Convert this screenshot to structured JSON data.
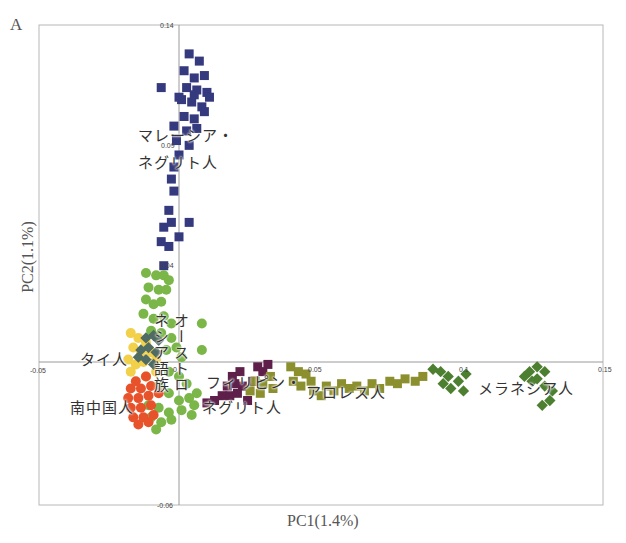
{
  "panel_letter": "A",
  "chart_data": {
    "type": "scatter",
    "title": "",
    "xlabel": "PC1(1.4%)",
    "ylabel": "PC2(1.1%)",
    "xlim": [
      -0.05,
      0.15
    ],
    "ylim": [
      -0.06,
      0.14
    ],
    "x_ticks": [
      "-0.05",
      "0.05",
      "0.1",
      "0.15"
    ],
    "y_ticks": [
      "0.14",
      "0.09",
      "0.04",
      "-0.06"
    ],
    "tick_labels_rendered": {
      "y_top": "0.14",
      "y_mid1": "0.09",
      "y_mid2": "0.04",
      "y_bottom": "-0.06",
      "x_left": "-0.05",
      "x_mid1": "0.05",
      "x_mid2": "0.1",
      "x_right": "0.15",
      "origin": "0"
    },
    "grid": false,
    "legend": "inline labels",
    "series": [
      {
        "name": "マレーシア・ネグリト人",
        "color": "#353a7e",
        "marker": "square",
        "points": [
          [
            0.004,
            0.128
          ],
          [
            0.008,
            0.125
          ],
          [
            0.002,
            0.121
          ],
          [
            0.006,
            0.118
          ],
          [
            0.01,
            0.119
          ],
          [
            0.003,
            0.114
          ],
          [
            0.007,
            0.113
          ],
          [
            0.011,
            0.112
          ],
          [
            0.001,
            0.109
          ],
          [
            0.005,
            0.108
          ],
          [
            0.009,
            0.106
          ],
          [
            0.002,
            0.102
          ],
          [
            0.006,
            0.101
          ],
          [
            0.01,
            0.104
          ],
          [
            -0.002,
            0.098
          ],
          [
            0.003,
            0.096
          ],
          [
            0.007,
            0.097
          ],
          [
            -0.001,
            0.092
          ],
          [
            0.004,
            0.09
          ],
          [
            0.0,
            0.086
          ],
          [
            -0.002,
            0.081
          ],
          [
            -0.003,
            0.076
          ],
          [
            -0.002,
            0.071
          ],
          [
            -0.004,
            0.063
          ],
          [
            -0.003,
            0.058
          ],
          [
            -0.006,
            0.056
          ],
          [
            0.004,
            0.058
          ],
          [
            -0.007,
            0.05
          ],
          [
            -0.004,
            0.048
          ],
          [
            -0.006,
            0.04
          ],
          [
            0.0,
            0.052
          ],
          [
            0.006,
            0.111
          ],
          [
            0.012,
            0.11
          ],
          [
            0.0,
            0.11
          ],
          [
            -0.007,
            0.114
          ]
        ]
      },
      {
        "name": "オーストロネシア語族",
        "color": "#7ab648",
        "marker": "circle",
        "points": [
          [
            -0.013,
            0.037
          ],
          [
            -0.009,
            0.036
          ],
          [
            -0.006,
            0.036
          ],
          [
            -0.004,
            0.034
          ],
          [
            -0.012,
            0.031
          ],
          [
            -0.008,
            0.03
          ],
          [
            -0.005,
            0.03
          ],
          [
            -0.013,
            0.026
          ],
          [
            -0.01,
            0.024
          ],
          [
            -0.007,
            0.025
          ],
          [
            -0.014,
            0.02
          ],
          [
            -0.01,
            0.018
          ],
          [
            -0.006,
            0.019
          ],
          [
            -0.003,
            0.016
          ],
          [
            -0.011,
            0.013
          ],
          [
            -0.007,
            0.012
          ],
          [
            -0.003,
            0.01
          ],
          [
            -0.001,
            0.006
          ],
          [
            -0.005,
            0.005
          ],
          [
            0.001,
            0.002
          ],
          [
            0.009,
            0.016
          ],
          [
            0.009,
            0.005
          ],
          [
            -0.004,
            -0.004
          ],
          [
            0.0,
            -0.006
          ],
          [
            0.003,
            -0.009
          ],
          [
            -0.008,
            -0.01
          ],
          [
            -0.004,
            -0.013
          ],
          [
            0.0,
            -0.016
          ],
          [
            0.004,
            -0.015
          ],
          [
            0.007,
            -0.013
          ],
          [
            -0.012,
            -0.018
          ],
          [
            -0.008,
            -0.019
          ],
          [
            -0.004,
            -0.021
          ],
          [
            -0.011,
            -0.023
          ],
          [
            -0.007,
            -0.025
          ],
          [
            -0.003,
            -0.024
          ],
          [
            0.001,
            -0.02
          ],
          [
            0.006,
            -0.018
          ],
          [
            0.005,
            -0.022
          ],
          [
            -0.009,
            -0.028
          ]
        ]
      },
      {
        "name": "タイ人",
        "color": "#f2d04a",
        "marker": "circle",
        "points": [
          [
            -0.019,
            0.012
          ],
          [
            -0.016,
            0.01
          ],
          [
            -0.013,
            0.008
          ],
          [
            -0.018,
            0.006
          ],
          [
            -0.015,
            0.004
          ],
          [
            -0.011,
            0.004
          ],
          [
            -0.02,
            0.001
          ],
          [
            -0.017,
            -0.001
          ],
          [
            -0.014,
            0.0
          ],
          [
            -0.009,
            0.001
          ],
          [
            -0.019,
            -0.004
          ],
          [
            -0.013,
            -0.006
          ],
          [
            -0.009,
            -0.004
          ]
        ]
      },
      {
        "name": "タイ人(灰緑)",
        "color": "#4f6b63",
        "marker": "diamond",
        "points": [
          [
            -0.013,
            0.01
          ],
          [
            -0.01,
            0.011
          ],
          [
            -0.008,
            0.009
          ],
          [
            -0.015,
            0.005
          ],
          [
            -0.012,
            0.006
          ],
          [
            -0.009,
            0.004
          ],
          [
            -0.016,
            0.002
          ],
          [
            -0.013,
            0.001
          ],
          [
            -0.01,
            -0.001
          ]
        ]
      },
      {
        "name": "南中国人",
        "color": "#e8522a",
        "marker": "circle",
        "points": [
          [
            -0.017,
            -0.008
          ],
          [
            -0.013,
            -0.006
          ],
          [
            -0.019,
            -0.011
          ],
          [
            -0.015,
            -0.011
          ],
          [
            -0.011,
            -0.01
          ],
          [
            -0.02,
            -0.015
          ],
          [
            -0.016,
            -0.015
          ],
          [
            -0.012,
            -0.014
          ],
          [
            -0.008,
            -0.013
          ],
          [
            -0.019,
            -0.019
          ],
          [
            -0.015,
            -0.019
          ],
          [
            -0.011,
            -0.018
          ],
          [
            -0.018,
            -0.023
          ],
          [
            -0.014,
            -0.023
          ],
          [
            -0.01,
            -0.022
          ],
          [
            -0.016,
            -0.026
          ],
          [
            -0.012,
            -0.025
          ]
        ]
      },
      {
        "name": "フィリピン・ネグリト人",
        "color": "#5e1f4a",
        "marker": "square",
        "points": [
          [
            0.021,
            -0.006
          ],
          [
            0.024,
            -0.004
          ],
          [
            0.019,
            -0.01
          ],
          [
            0.022,
            -0.009
          ],
          [
            0.025,
            -0.01
          ],
          [
            0.017,
            -0.014
          ],
          [
            0.02,
            -0.014
          ],
          [
            0.023,
            -0.013
          ],
          [
            0.014,
            -0.016
          ],
          [
            0.027,
            -0.016
          ],
          [
            0.011,
            -0.017
          ],
          [
            0.031,
            -0.002
          ],
          [
            0.033,
            -0.004
          ],
          [
            0.035,
            -0.001
          ],
          [
            0.029,
            -0.008
          ]
        ]
      },
      {
        "name": "アロレス人",
        "color": "#8c8f2e",
        "marker": "square",
        "points": [
          [
            0.03,
            -0.008
          ],
          [
            0.033,
            -0.009
          ],
          [
            0.036,
            -0.006
          ],
          [
            0.037,
            -0.011
          ],
          [
            0.032,
            -0.013
          ],
          [
            0.028,
            -0.012
          ],
          [
            0.044,
            -0.002
          ],
          [
            0.047,
            -0.004
          ],
          [
            0.05,
            -0.005
          ],
          [
            0.045,
            -0.008
          ],
          [
            0.048,
            -0.01
          ],
          [
            0.052,
            -0.008
          ],
          [
            0.053,
            -0.012
          ],
          [
            0.056,
            -0.014
          ],
          [
            0.058,
            -0.01
          ],
          [
            0.061,
            -0.012
          ],
          [
            0.064,
            -0.009
          ],
          [
            0.067,
            -0.011
          ],
          [
            0.07,
            -0.01
          ],
          [
            0.073,
            -0.012
          ],
          [
            0.076,
            -0.009
          ],
          [
            0.079,
            -0.011
          ],
          [
            0.083,
            -0.008
          ],
          [
            0.086,
            -0.009
          ],
          [
            0.089,
            -0.007
          ],
          [
            0.093,
            -0.008
          ],
          [
            0.096,
            -0.006
          ]
        ]
      },
      {
        "name": "メラネシア人",
        "color": "#4d7f30",
        "marker": "diamond",
        "points": [
          [
            0.1,
            -0.003
          ],
          [
            0.103,
            -0.004
          ],
          [
            0.106,
            -0.006
          ],
          [
            0.104,
            -0.009
          ],
          [
            0.107,
            -0.011
          ],
          [
            0.11,
            -0.008
          ],
          [
            0.113,
            -0.005
          ],
          [
            0.112,
            -0.012
          ],
          [
            0.138,
            -0.004
          ],
          [
            0.141,
            -0.002
          ],
          [
            0.144,
            -0.004
          ],
          [
            0.141,
            -0.007
          ],
          [
            0.144,
            -0.01
          ],
          [
            0.147,
            -0.012
          ],
          [
            0.146,
            -0.016
          ],
          [
            0.143,
            -0.018
          ],
          [
            0.139,
            -0.008
          ],
          [
            0.136,
            -0.006
          ]
        ]
      }
    ]
  },
  "labels": {
    "malaysia_negrito_line1": "マレーシア・",
    "malaysia_negrito_line2": "ネグリト人",
    "austronesian_vertical": "オーストロネシア語族",
    "austronesian_col1": "オーストロ",
    "austronesian_col2": "ネシア語族",
    "thai": "タイ人",
    "south_chinese": "南中国人",
    "philippine_negrito_line1": "フィリピン・",
    "philippine_negrito_line2": "ネグリト人",
    "alorese": "アロレス人",
    "melanesian": "メラネシア人"
  }
}
